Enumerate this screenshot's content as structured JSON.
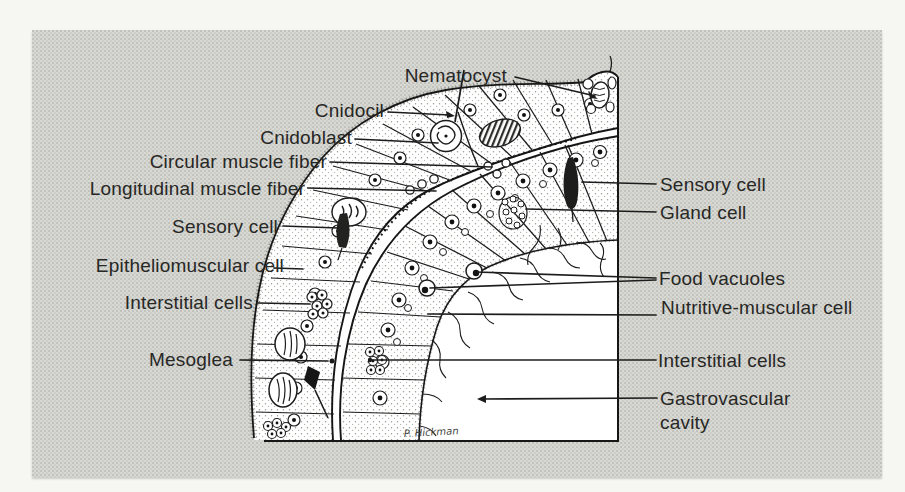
{
  "labels": {
    "nematocyst": "Nematocyst",
    "cnidocil": "Cnidocil",
    "cnidoblast": "Cnidoblast",
    "circular_muscle_fiber": "Circular muscle fiber",
    "longitudinal_muscle_fiber": "Longitudinal muscle fiber",
    "sensory_cell_left": "Sensory cell",
    "epitheliomuscular_cell": "Epitheliomuscular cell",
    "interstitial_cells_left": "Interstitial cells",
    "mesoglea": "Mesoglea",
    "sensory_cell_right": "Sensory cell",
    "gland_cell": "Gland cell",
    "food_vacuoles": "Food vacuoles",
    "nutritive_muscular_cell": "Nutritive-muscular cell",
    "interstitial_cells_right": "Interstitial cells",
    "gastrovascular_cavity": "Gastrovascular cavity"
  },
  "signature": "P. Hickman",
  "colors": {
    "page_background": "#f6f6f3",
    "panel_background": "#d8d8d4",
    "ink": "#1c1c1c",
    "paper_white": "#ffffff",
    "label_text": "#272725"
  }
}
